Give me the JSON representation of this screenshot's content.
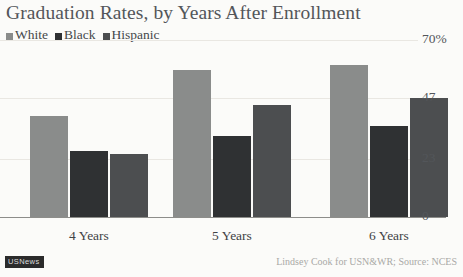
{
  "chart_data": {
    "type": "bar",
    "title": "Graduation Rates, by Years After Enrollment",
    "xlabel": "",
    "ylabel": "",
    "categories": [
      "4 Years",
      "5 Years",
      "6 Years"
    ],
    "series": [
      {
        "name": "White",
        "color": "#8a8c8b",
        "values": [
          40,
          58,
          60
        ]
      },
      {
        "name": "Black",
        "color": "#2f3133",
        "values": [
          26,
          32,
          36
        ]
      },
      {
        "name": "Hispanic",
        "color": "#4c4e50",
        "values": [
          25,
          44,
          47
        ]
      }
    ],
    "ylim": [
      0,
      70
    ],
    "ytick_labels": [
      "70%",
      "47",
      "23",
      "0"
    ],
    "ytick_values": [
      70,
      47,
      23,
      0
    ],
    "grid": true,
    "legend_position": "top-left",
    "axis_suffix": "%"
  },
  "yticks": [
    {
      "label": "70%",
      "value": 70
    },
    {
      "label": "47",
      "value": 47
    },
    {
      "label": "23",
      "value": 23
    },
    {
      "label": "0",
      "value": 0
    }
  ],
  "footer": {
    "badge": "USNews",
    "credit": "Lindsey Cook for USN&WR; Source: NCES"
  },
  "colors": {
    "white_series": "#8a8c8b",
    "black_series": "#2f3133",
    "hispanic_series": "#4c4e50",
    "title_text": "#53565a",
    "grid": "#e9e7e2",
    "axis": "#8d8d8a",
    "background": "#fbfbf9"
  }
}
